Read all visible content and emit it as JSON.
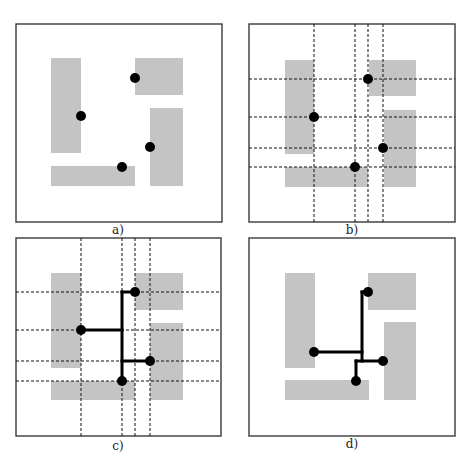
{
  "figure": {
    "colors": {
      "frame": "#3a3a3a",
      "obstacle": "#c4c4c4",
      "grid": "#111111",
      "wire": "#000000",
      "pin": "#000000"
    },
    "panels": [
      {
        "id": "a",
        "caption": "a)",
        "frame": [
          16,
          24,
          206,
          198
        ],
        "caption_pos": [
          118,
          234
        ],
        "obstacles": [
          [
            51,
            58,
            30,
            95
          ],
          [
            135,
            58,
            48,
            37
          ],
          [
            150,
            108,
            33,
            78
          ],
          [
            51,
            166,
            84,
            20
          ]
        ],
        "pins": [
          [
            135,
            78
          ],
          [
            81,
            116
          ],
          [
            150,
            147
          ],
          [
            122,
            167
          ]
        ],
        "grid_x": [],
        "grid_y": [],
        "wires": []
      },
      {
        "id": "b",
        "caption": "b)",
        "frame": [
          249,
          24,
          206,
          198
        ],
        "caption_pos": [
          352,
          234
        ],
        "obstacles": [
          [
            285,
            60,
            29,
            94
          ],
          [
            369,
            60,
            47,
            36
          ],
          [
            384,
            110,
            32,
            77
          ],
          [
            285,
            167,
            83,
            20
          ]
        ],
        "pins": [
          [
            368,
            79
          ],
          [
            314,
            117
          ],
          [
            383,
            148
          ],
          [
            355,
            167
          ]
        ],
        "grid_x": [
          314,
          355,
          368,
          383
        ],
        "grid_y": [
          79,
          117,
          148,
          167
        ],
        "wires": []
      },
      {
        "id": "c",
        "caption": "c)",
        "frame": [
          16,
          238,
          205,
          198
        ],
        "caption_pos": [
          118,
          450
        ],
        "obstacles": [
          [
            51,
            273,
            30,
            95
          ],
          [
            135,
            273,
            48,
            37
          ],
          [
            150,
            323,
            33,
            77
          ],
          [
            51,
            381,
            84,
            19
          ]
        ],
        "pins": [
          [
            135,
            292
          ],
          [
            81,
            330
          ],
          [
            150,
            361
          ],
          [
            122,
            381
          ]
        ],
        "grid_x": [
          81,
          122,
          135,
          150
        ],
        "grid_y": [
          292,
          330,
          361,
          381
        ],
        "wires": [
          [
            [
              122,
              292
            ],
            [
              122,
              381
            ]
          ],
          [
            [
              81,
              330
            ],
            [
              122,
              330
            ]
          ],
          [
            [
              122,
              292
            ],
            [
              135,
              292
            ]
          ],
          [
            [
              122,
              361
            ],
            [
              150,
              361
            ]
          ]
        ]
      },
      {
        "id": "d",
        "caption": "d)",
        "frame": [
          249,
          238,
          206,
          198
        ],
        "caption_pos": [
          352,
          448
        ],
        "obstacles": [
          [
            285,
            273,
            30,
            95
          ],
          [
            368,
            273,
            48,
            37
          ],
          [
            384,
            322,
            32,
            78
          ],
          [
            285,
            380,
            84,
            20
          ]
        ],
        "pins": [
          [
            368,
            292
          ],
          [
            314,
            352
          ],
          [
            383,
            361
          ],
          [
            356,
            381
          ]
        ],
        "grid_x": [],
        "grid_y": [],
        "wires": [
          [
            [
              362,
              292
            ],
            [
              362,
              361
            ]
          ],
          [
            [
              362,
              292
            ],
            [
              368,
              292
            ]
          ],
          [
            [
              314,
              352
            ],
            [
              362,
              352
            ]
          ],
          [
            [
              356,
              361
            ],
            [
              383,
              361
            ]
          ],
          [
            [
              356,
              361
            ],
            [
              356,
              381
            ]
          ]
        ]
      }
    ]
  }
}
